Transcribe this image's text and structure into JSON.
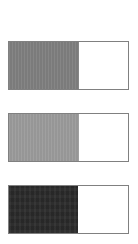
{
  "page": {
    "background_color": "#ffffff",
    "width": 138,
    "height": 244
  },
  "chart_data": {
    "type": "bar",
    "orientation": "horizontal",
    "title": "",
    "subtitle": "",
    "xlabel": "",
    "ylabel": "",
    "xlim": [
      0,
      100
    ],
    "grid": false,
    "legend_position": "none",
    "tick_labels": [],
    "annotations": [],
    "categories": [
      "Bar 1",
      "Bar 2",
      "Bar 3"
    ],
    "values": [
      58,
      58,
      57
    ],
    "units": "percent",
    "series": [
      {
        "name": "Fill",
        "values": [
          58,
          58,
          57
        ]
      }
    ]
  },
  "bars": [
    {
      "id": "bar-1",
      "label": "",
      "value": 58,
      "value_text": "58%",
      "fill_color": "#7f7f7f",
      "empty_color": "#ffffff",
      "border_color": "#808080",
      "texture": "texture-vertical",
      "geometry": {
        "left": 8,
        "top": 41,
        "width": 121,
        "height": 49,
        "fill_width": 70
      }
    },
    {
      "id": "bar-2",
      "label": "",
      "value": 58,
      "value_text": "58%",
      "fill_color": "#9b9b9b",
      "empty_color": "#ffffff",
      "border_color": "#808080",
      "texture": "texture-vertical",
      "geometry": {
        "left": 8,
        "top": 113,
        "width": 121,
        "height": 49,
        "fill_width": 70
      }
    },
    {
      "id": "bar-3",
      "label": "",
      "value": 57,
      "value_text": "57%",
      "fill_color": "#2b2b2b",
      "empty_color": "#ffffff",
      "border_color": "#808080",
      "texture": "texture-mottle",
      "geometry": {
        "left": 8,
        "top": 185,
        "width": 121,
        "height": 49,
        "fill_width": 69
      }
    }
  ]
}
